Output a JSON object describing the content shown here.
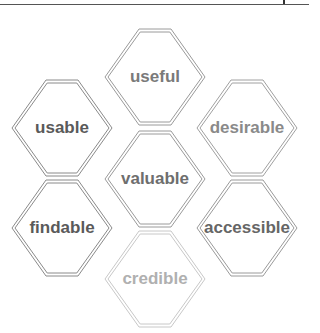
{
  "hexagons": [
    {
      "id": "useful",
      "label": "useful",
      "cx": 155,
      "cy": 77,
      "text_color": "#7a7a7a",
      "stroke": "#9a9a9a"
    },
    {
      "id": "usable",
      "label": "usable",
      "cx": 62,
      "cy": 128,
      "text_color": "#5a5a5a",
      "stroke": "#8a8a8a"
    },
    {
      "id": "desirable",
      "label": "desirable",
      "cx": 247,
      "cy": 128,
      "text_color": "#8a8a8a",
      "stroke": "#a0a0a0"
    },
    {
      "id": "valuable",
      "label": "valuable",
      "cx": 155,
      "cy": 179,
      "text_color": "#6e6e6e",
      "stroke": "#9a9a9a"
    },
    {
      "id": "findable",
      "label": "findable",
      "cx": 62,
      "cy": 228,
      "text_color": "#5a5a5a",
      "stroke": "#8a8a8a"
    },
    {
      "id": "accessible",
      "label": "accessible",
      "cx": 247,
      "cy": 228,
      "text_color": "#666666",
      "stroke": "#9a9a9a"
    },
    {
      "id": "credible",
      "label": "credible",
      "cx": 155,
      "cy": 279,
      "text_color": "#b0b0b0",
      "stroke": "#c8c8c8"
    }
  ]
}
